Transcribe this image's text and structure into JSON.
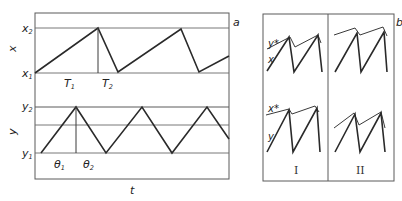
{
  "panel_a": {
    "label": "a",
    "x_axis_label": "t",
    "top_chart": {
      "y_axis_label": "x",
      "upper_level": {
        "base": "x",
        "sub": "2"
      },
      "lower_level": {
        "base": "x",
        "sub": "1"
      },
      "interval_1": {
        "base": "T",
        "sub": "1"
      },
      "interval_2": {
        "base": "T",
        "sub": "2"
      }
    },
    "bottom_chart": {
      "y_axis_label": "y",
      "upper_level": {
        "base": "y",
        "sub": "2"
      },
      "lower_level": {
        "base": "y",
        "sub": "1"
      },
      "interval_1": {
        "base": "θ",
        "sub": "1"
      },
      "interval_2": {
        "base": "θ",
        "sub": "2"
      }
    }
  },
  "panel_b": {
    "label": "b",
    "column_labels": [
      "I",
      "II"
    ],
    "top_row": {
      "threshold_label": "y*",
      "signal_label": "x"
    },
    "bottom_row": {
      "threshold_label": "x*",
      "signal_label": "y"
    }
  },
  "colors": {
    "line": "#2a2a2a",
    "frame": "#5a5a5a",
    "background": "#ffffff"
  }
}
